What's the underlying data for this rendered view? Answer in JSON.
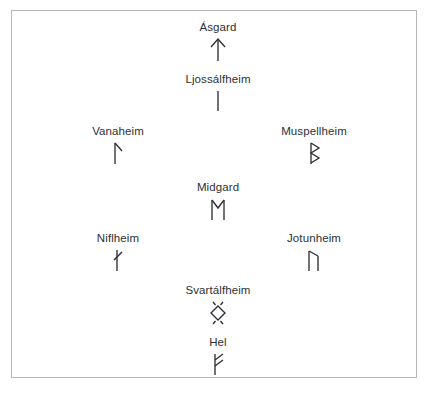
{
  "diagram": {
    "background_color": "#ffffff",
    "border_color": "#b6b6b6",
    "text_color": "#2f2f33",
    "realms": [
      {
        "label": "Ásgard",
        "rune_name": "tiwaz-rune",
        "rune_char": "ᛏ",
        "x": 217,
        "y": 20
      },
      {
        "label": "Ljossálfheim",
        "rune_name": "isa-rune",
        "rune_char": "ᛁ",
        "x": 217,
        "y": 72
      },
      {
        "label": "Vanaheim",
        "rune_name": "laguz-rune",
        "rune_char": "ᛚ",
        "x": 117,
        "y": 124
      },
      {
        "label": "Muspellheim",
        "rune_name": "berkanan-rune",
        "rune_char": "ᛒ",
        "x": 313,
        "y": 124
      },
      {
        "label": "Midgard",
        "rune_name": "ehwaz-rune",
        "rune_char": "ᛖ",
        "x": 217,
        "y": 180
      },
      {
        "label": "Niflheim",
        "rune_name": "naudiz-rune",
        "rune_char": "ᚾ",
        "x": 117,
        "y": 231
      },
      {
        "label": "Jotunheim",
        "rune_name": "uruz-rune",
        "rune_char": "ᚢ",
        "x": 313,
        "y": 231
      },
      {
        "label": "Svartálfheim",
        "rune_name": "ingwaz-rune",
        "rune_char": "ᛝ",
        "x": 217,
        "y": 283
      },
      {
        "label": "Hel",
        "rune_name": "fehu-rune",
        "rune_char": "ᚠ",
        "x": 217,
        "y": 335
      }
    ]
  }
}
